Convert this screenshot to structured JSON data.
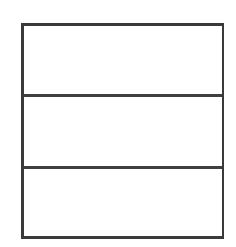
{
  "figure": {
    "background_color": "#ffffff",
    "line_color": "#3a3a3a",
    "fill_color": "#ffffff",
    "frame": {
      "x": 21,
      "y": 23,
      "width": 203,
      "height": 216,
      "stroke_width": 3
    },
    "dividers": [
      {
        "label": "upper-divider",
        "y": 94,
        "stroke_width": 3
      },
      {
        "label": "lower-divider",
        "y": 166,
        "stroke_width": 3
      }
    ],
    "bands": [
      {
        "label": "",
        "name": "top-band",
        "height": 68,
        "fill": "#ffffff"
      },
      {
        "label": "",
        "name": "middle-band",
        "height": 69,
        "fill": "#ffffff"
      },
      {
        "label": "",
        "name": "bottom-band",
        "height": 67,
        "fill": "#ffffff"
      }
    ]
  }
}
